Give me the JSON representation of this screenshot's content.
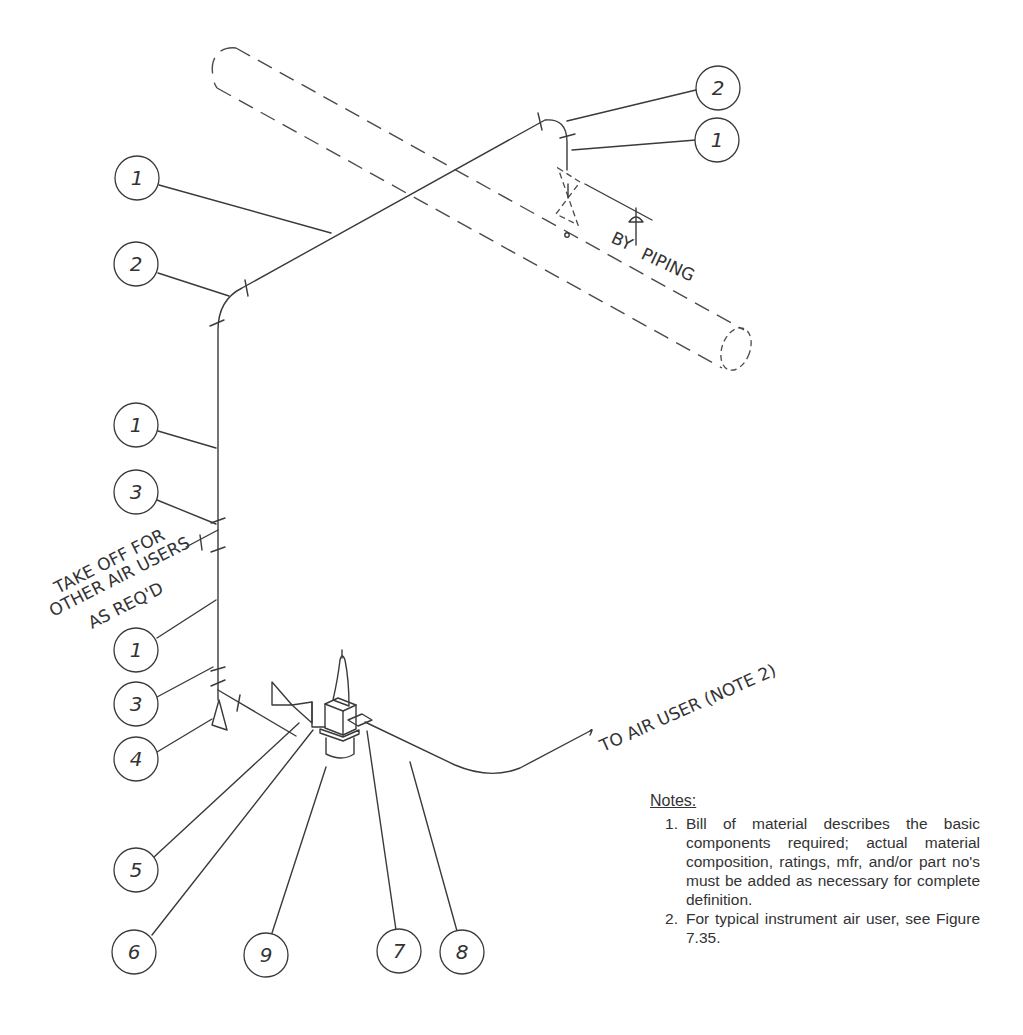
{
  "drawing": {
    "callouts": [
      {
        "id": "c-top-2",
        "label": "2",
        "cx": 718,
        "cy": 88
      },
      {
        "id": "c-top-1",
        "label": "1",
        "cx": 717,
        "cy": 140
      },
      {
        "id": "c-left-1a",
        "label": "1",
        "cx": 137,
        "cy": 178
      },
      {
        "id": "c-left-2",
        "label": "2",
        "cx": 136,
        "cy": 264
      },
      {
        "id": "c-left-1b",
        "label": "1",
        "cx": 136,
        "cy": 425
      },
      {
        "id": "c-left-3a",
        "label": "3",
        "cx": 136,
        "cy": 492
      },
      {
        "id": "c-left-1c",
        "label": "1",
        "cx": 136,
        "cy": 650
      },
      {
        "id": "c-left-3b",
        "label": "3",
        "cx": 136,
        "cy": 704
      },
      {
        "id": "c-left-4",
        "label": "4",
        "cx": 136,
        "cy": 759
      },
      {
        "id": "c-5",
        "label": "5",
        "cx": 136,
        "cy": 870
      },
      {
        "id": "c-6",
        "label": "6",
        "cx": 134,
        "cy": 952
      },
      {
        "id": "c-9",
        "label": "9",
        "cx": 266,
        "cy": 955
      },
      {
        "id": "c-7",
        "label": "7",
        "cx": 399,
        "cy": 951
      },
      {
        "id": "c-8",
        "label": "8",
        "cx": 462,
        "cy": 952
      }
    ],
    "annotations": {
      "by_piping": {
        "line1": "BY",
        "line2": "PIPING"
      },
      "take_off": {
        "line1": "TAKE OFF FOR",
        "line2": "OTHER AIR USERS",
        "line3": "AS REQ'D"
      },
      "to_air_user": "TO AIR USER (NOTE 2)"
    }
  },
  "notes": {
    "title": "Notes:",
    "items": [
      {
        "num": "1.",
        "text": "Bill of material describes the basic components required; actual material composition, ratings, mfr, and/or part no's must be added as necessary for complete definition."
      },
      {
        "num": "2.",
        "text": "For typical instrument air user, see Figure 7.35."
      }
    ]
  }
}
